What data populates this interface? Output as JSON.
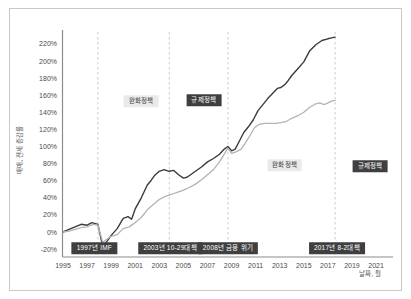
{
  "chart_data": {
    "type": "line",
    "title": "",
    "xlabel": "날짜, 월",
    "ylabel": "매매, 전세 증감률",
    "xlim": [
      1995,
      2022.5
    ],
    "ylim": [
      -28,
      236
    ],
    "grid": false,
    "legend": "none",
    "x_ticks": [
      "1995",
      "1997",
      "1999",
      "2001",
      "2003",
      "2005",
      "2007",
      "2009",
      "2011",
      "2013",
      "2015",
      "2017",
      "2019",
      "2021"
    ],
    "y_ticks": [
      {
        "value": 220,
        "label": "220%"
      },
      {
        "value": 200,
        "label": "200%"
      },
      {
        "value": 180,
        "label": "180%"
      },
      {
        "value": 160,
        "label": "160%"
      },
      {
        "value": 140,
        "label": "140%"
      },
      {
        "value": 120,
        "label": "120%"
      },
      {
        "value": 100,
        "label": "100%"
      },
      {
        "value": 80,
        "label": "80%"
      },
      {
        "value": 60,
        "label": "60%"
      },
      {
        "value": 40,
        "label": "40%"
      },
      {
        "value": 20,
        "label": "20%"
      },
      {
        "value": 0,
        "label": "0%"
      },
      {
        "value": -20,
        "label": "-20%"
      }
    ],
    "colors": {
      "axis": "#8c8c8c",
      "tick_text": "#4a4a4a",
      "dashed_line": "#c4c4c4",
      "series_dark": "#3b3b3b",
      "series_light": "#b3b3b3",
      "label_dark_bg": "#3f3f3f",
      "label_dark_fg": "#ffffff",
      "label_light_bg": "#eaeaea",
      "label_light_fg": "#3a3a3a"
    },
    "vlines": [
      1997.9,
      2003.83,
      2008.7,
      2017.6
    ],
    "series": [
      {
        "name": "dark-line",
        "color": "#3b3b3b",
        "x": [
          1995.0,
          1995.5,
          1996.0,
          1996.5,
          1997.0,
          1997.4,
          1997.9,
          1998.3,
          1998.7,
          1999.0,
          1999.5,
          2000.0,
          2000.4,
          2000.7,
          2001.0,
          2001.5,
          2002.0,
          2002.3,
          2002.6,
          2003.0,
          2003.4,
          2003.8,
          2004.2,
          2004.6,
          2005.0,
          2005.3,
          2005.6,
          2006.0,
          2006.5,
          2007.0,
          2007.5,
          2008.0,
          2008.4,
          2008.7,
          2009.0,
          2009.3,
          2009.6,
          2010.0,
          2010.4,
          2010.8,
          2011.2,
          2011.6,
          2012.0,
          2012.4,
          2012.8,
          2013.1,
          2013.4,
          2013.7,
          2014.0,
          2014.5,
          2015.0,
          2015.5,
          2016.0,
          2016.5,
          2017.0,
          2017.3,
          2017.6
        ],
        "y": [
          0,
          3,
          6,
          9,
          8,
          11,
          9,
          -17,
          -10,
          -4,
          4,
          16,
          18,
          15,
          27,
          40,
          55,
          60,
          66,
          71,
          73,
          71,
          72,
          67,
          63,
          64,
          67,
          71,
          76,
          82,
          86,
          91,
          97,
          100,
          95,
          97,
          105,
          116,
          123,
          131,
          142,
          149,
          156,
          162,
          168,
          169,
          172,
          177,
          183,
          191,
          199,
          212,
          219,
          224,
          226,
          227,
          228
        ]
      },
      {
        "name": "light-line",
        "color": "#b3b3b3",
        "x": [
          1995.0,
          1995.5,
          1996.0,
          1996.5,
          1997.0,
          1997.5,
          1997.9,
          1998.3,
          1998.7,
          1999.0,
          1999.5,
          2000.0,
          2000.5,
          2001.0,
          2001.5,
          2002.0,
          2002.5,
          2003.0,
          2003.4,
          2003.8,
          2004.2,
          2004.6,
          2005.0,
          2005.5,
          2006.0,
          2006.5,
          2007.0,
          2007.5,
          2008.0,
          2008.4,
          2008.7,
          2009.0,
          2009.4,
          2009.8,
          2010.1,
          2010.5,
          2010.9,
          2011.3,
          2011.7,
          2012.2,
          2012.7,
          2013.1,
          2013.5,
          2014.0,
          2014.5,
          2015.0,
          2015.5,
          2016.0,
          2016.3,
          2016.7,
          2017.0,
          2017.3,
          2017.6
        ],
        "y": [
          0,
          1,
          3,
          5,
          6,
          9,
          8,
          -12,
          -8,
          -5,
          -3,
          4,
          6,
          11,
          17,
          26,
          32,
          38,
          41,
          43,
          45,
          47,
          49,
          52,
          56,
          61,
          67,
          73,
          82,
          91,
          98,
          92,
          94,
          97,
          103,
          112,
          122,
          126,
          127,
          127,
          127,
          128,
          129,
          133,
          136,
          140,
          146,
          150,
          151,
          149,
          151,
          153,
          154
        ]
      }
    ],
    "annotations": {
      "policy": [
        {
          "text": "완화정책",
          "variant": "light",
          "x": 2001.5,
          "y": 153
        },
        {
          "text": "규제정책",
          "variant": "dark",
          "x": 2006.7,
          "y": 154
        },
        {
          "text": "완화정책",
          "variant": "light",
          "x": 2013.4,
          "y": 78
        },
        {
          "text": "규제정책",
          "variant": "dark",
          "x": 2020.5,
          "y": 77
        }
      ],
      "events": [
        {
          "text": "1997년 IMF",
          "variant": "dark",
          "x": 1997.6,
          "y": -19
        },
        {
          "text": "2003년 10-29대책",
          "variant": "dark",
          "x": 2003.9,
          "y": -19
        },
        {
          "text": "2008년 금융 위기",
          "variant": "dark",
          "x": 2008.7,
          "y": -19
        },
        {
          "text": "2017년 8-2대책",
          "variant": "dark",
          "x": 2017.75,
          "y": -19
        }
      ]
    }
  }
}
